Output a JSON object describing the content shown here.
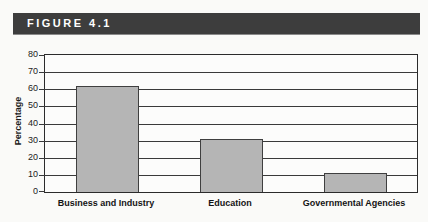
{
  "figure": {
    "label": "FIGURE 4.1"
  },
  "chart_data": {
    "type": "bar",
    "categories": [
      "Business and Industry",
      "Education",
      "Governmental Agencies"
    ],
    "values": [
      62,
      31,
      11
    ],
    "title": "",
    "xlabel": "",
    "ylabel": "Percentage",
    "ylim": [
      0,
      80
    ],
    "ytick_interval": 10,
    "yticks": [
      0,
      10,
      20,
      30,
      40,
      50,
      60,
      70,
      80
    ],
    "grid": true,
    "legend": "none",
    "bar_color": "#b5b5b5",
    "bar_border_color": "#3f3f3f"
  },
  "colors": {
    "header_bg": "#3d3d3d",
    "header_text": "#ffffff",
    "page_bg": "#fafaf8",
    "axis": "#2b2b2b"
  }
}
